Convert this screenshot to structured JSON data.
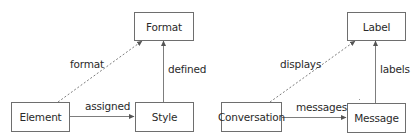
{
  "diagrams": [
    {
      "nodes": {
        "format": {
          "label": "Format"
        },
        "element": {
          "label": "Element"
        },
        "style": {
          "label": "Style"
        }
      },
      "edges": {
        "element_to_format": {
          "label": "format",
          "style": "dashed"
        },
        "element_to_style": {
          "label": "assigned",
          "style": "solid"
        },
        "style_to_format": {
          "label": "defined",
          "style": "solid"
        }
      }
    },
    {
      "nodes": {
        "label": {
          "label": "Label"
        },
        "conversation": {
          "label": "Conversation"
        },
        "message": {
          "label": "Message"
        }
      },
      "edges": {
        "conversation_to_label": {
          "label": "displays",
          "style": "dashed"
        },
        "conversation_to_message": {
          "label": "messages",
          "style": "solid"
        },
        "message_to_label": {
          "label": "labels",
          "style": "solid"
        }
      }
    }
  ],
  "colors": {
    "stroke": "#6e6e6e",
    "text": "#2a2a2a",
    "background": "#ffffff"
  }
}
